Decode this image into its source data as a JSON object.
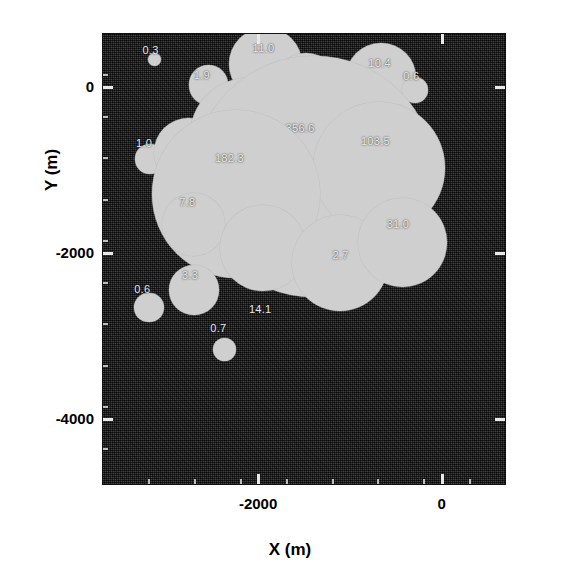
{
  "chart_data": {
    "type": "scatter",
    "title": "",
    "xlabel": "X (m)",
    "ylabel": "Y (m)",
    "xlim": [
      -3700,
      700
    ],
    "ylim": [
      -4800,
      650
    ],
    "xticks": [
      -2000,
      0
    ],
    "xtick_labels": [
      "-2000",
      "0"
    ],
    "yticks": [
      0,
      -2000,
      -4000
    ],
    "ytick_labels": [
      "0",
      "-2000",
      "-4000"
    ],
    "grid": false,
    "legend": null,
    "marker_shape": "circle",
    "marker_color": "#cfcfcf",
    "background_color": "#2e2e2e",
    "size_encoding": "area proportional to labelled value",
    "points": [
      {
        "label": "0.3",
        "value": 0.3,
        "x": -3130,
        "y": 330,
        "r": 4,
        "lx": -3260,
        "ly": 520
      },
      {
        "label": "1.9",
        "value": 1.9,
        "x": -2540,
        "y": 20,
        "r": 12,
        "lx": -2700,
        "ly": 220
      },
      {
        "label": "11.0",
        "value": 11.0,
        "x": -1920,
        "y": 275,
        "r": 22,
        "lx": -2060,
        "ly": 540
      },
      {
        "label": "9.4",
        "value": 9.4,
        "x": -1480,
        "y": 5,
        "r": 20,
        "lx": -1640,
        "ly": 245
      },
      {
        "label": "10.4",
        "value": 10.4,
        "x": -660,
        "y": 105,
        "r": 21,
        "lx": -800,
        "ly": 360
      },
      {
        "label": "0.6",
        "value": 0.6,
        "x": -290,
        "y": -40,
        "r": 8,
        "lx": -420,
        "ly": 200
      },
      {
        "label": "1.0",
        "value": 1.0,
        "x": -3180,
        "y": -870,
        "r": 9,
        "lx": -3330,
        "ly": -600
      },
      {
        "label": "10.6",
        "value": 10.6,
        "x": -2760,
        "y": -790,
        "r": 21,
        "lx": -2930,
        "ly": -600
      },
      {
        "label": "63.7",
        "value": 63.7,
        "x": -2110,
        "y": -590,
        "r": 35,
        "lx": -2300,
        "ly": -230
      },
      {
        "label": "356.6",
        "value": 356.6,
        "x": -1390,
        "y": -1080,
        "r": 73,
        "lx": -1700,
        "ly": -420
      },
      {
        "label": "103.5",
        "value": 103.5,
        "x": -680,
        "y": -980,
        "r": 40,
        "lx": -880,
        "ly": -580
      },
      {
        "label": "182.3",
        "value": 182.3,
        "x": -2240,
        "y": -1290,
        "r": 51,
        "lx": -2470,
        "ly": -790
      },
      {
        "label": "7.8",
        "value": 7.8,
        "x": -2700,
        "y": -1660,
        "r": 19,
        "lx": -2860,
        "ly": -1320
      },
      {
        "label": "14.1",
        "value": 14.1,
        "x": -1950,
        "y": -1940,
        "r": 26,
        "lx": -2100,
        "ly": -2600
      },
      {
        "label": "2.7",
        "value": 2.7,
        "x": -1110,
        "y": -2120,
        "r": 29,
        "lx": -1190,
        "ly": -1960
      },
      {
        "label": "31.0",
        "value": 31.0,
        "x": -430,
        "y": -1880,
        "r": 27,
        "lx": -600,
        "ly": -1580
      },
      {
        "label": "3.3",
        "value": 3.3,
        "x": -2700,
        "y": -2450,
        "r": 15,
        "lx": -2830,
        "ly": -2200
      },
      {
        "label": "0.6",
        "value": 0.6,
        "x": -3190,
        "y": -2660,
        "r": 9,
        "lx": -3350,
        "ly": -2370
      },
      {
        "label": "0.7",
        "value": 0.7,
        "x": -2370,
        "y": -3170,
        "r": 7,
        "lx": -2520,
        "ly": -2830
      }
    ]
  }
}
